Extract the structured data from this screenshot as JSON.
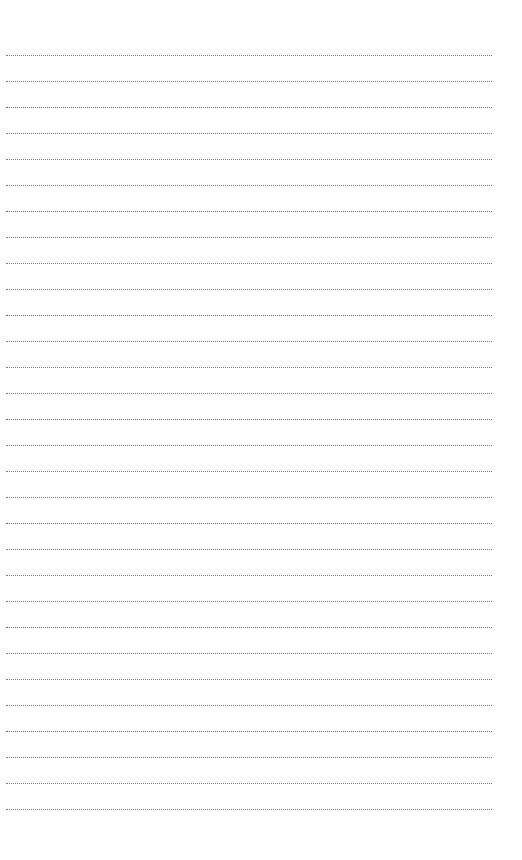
{
  "page": {
    "type": "lined-notepaper",
    "line_count": 30,
    "line_style": "dotted",
    "line_color": "#7a7a7a",
    "background": "#ffffff",
    "lines": [
      "",
      "",
      "",
      "",
      "",
      "",
      "",
      "",
      "",
      "",
      "",
      "",
      "",
      "",
      "",
      "",
      "",
      "",
      "",
      "",
      "",
      "",
      "",
      "",
      "",
      "",
      "",
      "",
      "",
      ""
    ]
  }
}
